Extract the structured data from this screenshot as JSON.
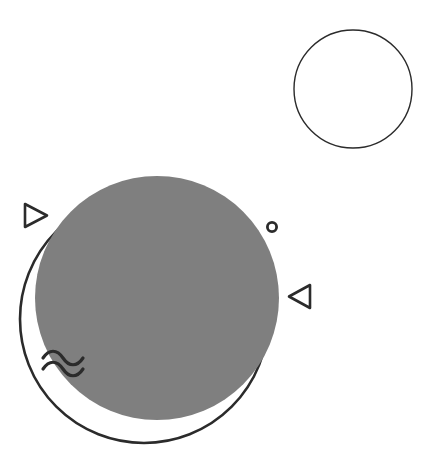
{
  "canvas": {
    "width": 440,
    "height": 465,
    "background_color": "#ffffff",
    "title": "Abstract geometric composition"
  },
  "palette": {
    "gray_fill": "#7f7f7f",
    "outline": "#2b2b2b",
    "outline_light": "#444444",
    "background": "#ffffff"
  },
  "shapes": {
    "top_right_circle": {
      "name": "outlined-circle-top-right",
      "type": "circle-outline",
      "cx": 353,
      "cy": 89,
      "r": 59,
      "stroke_width": 1.4,
      "stroke_color": "#444444",
      "fill": "none"
    },
    "large_outline_circle": {
      "name": "outlined-circle-large",
      "type": "circle-outline",
      "cx": 144,
      "cy": 319,
      "r": 124,
      "stroke_width": 2.6,
      "stroke_color": "#2b2b2b",
      "fill": "none"
    },
    "large_gray_circle": {
      "name": "filled-circle-gray",
      "type": "circle-filled",
      "cx": 157,
      "cy": 298,
      "r": 122,
      "fill_color": "#7f7f7f"
    },
    "triangle_left": {
      "name": "triangle-right-pointing",
      "type": "triangle-outline",
      "points": "25,204 47,215.5 25,227",
      "direction": "right",
      "stroke_width": 2.6,
      "stroke_color": "#2b2b2b"
    },
    "triangle_right": {
      "name": "triangle-left-pointing",
      "type": "triangle-outline",
      "points": "310,285 310,308 289,296.5",
      "direction": "left",
      "stroke_width": 2.6,
      "stroke_color": "#2b2b2b"
    },
    "small_ring": {
      "name": "small-ring-marker",
      "type": "ring",
      "cx": 272,
      "cy": 227,
      "r": 4.6,
      "stroke_width": 2.8,
      "stroke_color": "#2b2b2b"
    },
    "wave_top": {
      "name": "wave-line-top",
      "type": "wave",
      "path": "M43,358 C49,349 57,349 63,358 C69,367 77,367 83,358",
      "stroke_width": 3.2,
      "stroke_color": "#2b2b2b"
    },
    "wave_bottom": {
      "name": "wave-line-bottom",
      "type": "wave",
      "path": "M43,369 C49,360 57,360 63,369 C69,378 77,378 83,369",
      "stroke_width": 3.2,
      "stroke_color": "#2b2b2b"
    }
  },
  "layer_order": [
    "outlined-circle-top-right",
    "outlined-circle-large",
    "filled-circle-gray",
    "triangle-right-pointing",
    "triangle-left-pointing",
    "small-ring-marker",
    "wave-line-top",
    "wave-line-bottom"
  ]
}
